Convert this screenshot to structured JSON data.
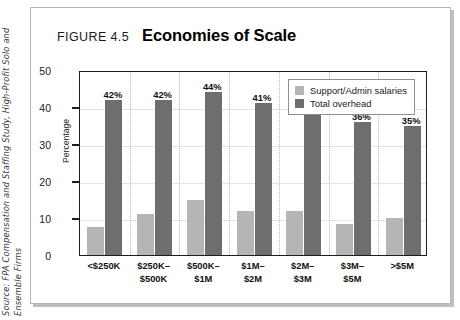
{
  "source_credit": "Source: FPA Compensation and Staffing Study, High-Profit Solo and Ensemble Firms",
  "figure": {
    "number_label": "FIGURE 4.5",
    "title": "Economies of Scale"
  },
  "colors": {
    "support_admin": "#b5b5b5",
    "total_overhead": "#6e6e6e",
    "frame_border": "#b6b6b6",
    "axis": "#1c1c1c",
    "gridline": "#e3e3e3"
  },
  "chart_data": {
    "type": "bar",
    "title": "Economies of Scale",
    "xlabel": "",
    "ylabel": "Percentage",
    "ylim": [
      0,
      50
    ],
    "yticks": [
      0,
      10,
      20,
      30,
      40,
      50
    ],
    "ytick_labels": [
      "0",
      "10",
      "20",
      "30",
      "40",
      "50"
    ],
    "grid": true,
    "legend_position": "upper right",
    "categories": [
      "<$250K",
      "$250K–$500K",
      "$500K–$1M",
      "$1M–$2M",
      "$2M–$3M",
      "$3M–$5M",
      ">$5M"
    ],
    "category_lines": [
      [
        "<$250K"
      ],
      [
        "$250K–",
        "$500K"
      ],
      [
        "$500K–",
        "$1M"
      ],
      [
        "$1M–",
        "$2M"
      ],
      [
        "$2M–",
        "$3M"
      ],
      [
        "$3M–",
        "$5M"
      ],
      [
        ">$5M"
      ]
    ],
    "series": [
      {
        "name": "Support/Admin salaries",
        "color": "#b5b5b5",
        "values": [
          7.5,
          11,
          15,
          12,
          12,
          8.5,
          10
        ],
        "labels": [
          "",
          "",
          "",
          "",
          "",
          "",
          ""
        ]
      },
      {
        "name": "Total overhead",
        "color": "#6e6e6e",
        "values": [
          42,
          42,
          44,
          41,
          38,
          36,
          35
        ],
        "labels": [
          "42%",
          "42%",
          "44%",
          "41%",
          "38%",
          "36%",
          "35%"
        ]
      }
    ]
  },
  "legend": {
    "items": [
      {
        "label": "Support/Admin salaries",
        "color": "#b5b5b5"
      },
      {
        "label": "Total overhead",
        "color": "#6e6e6e"
      }
    ]
  }
}
